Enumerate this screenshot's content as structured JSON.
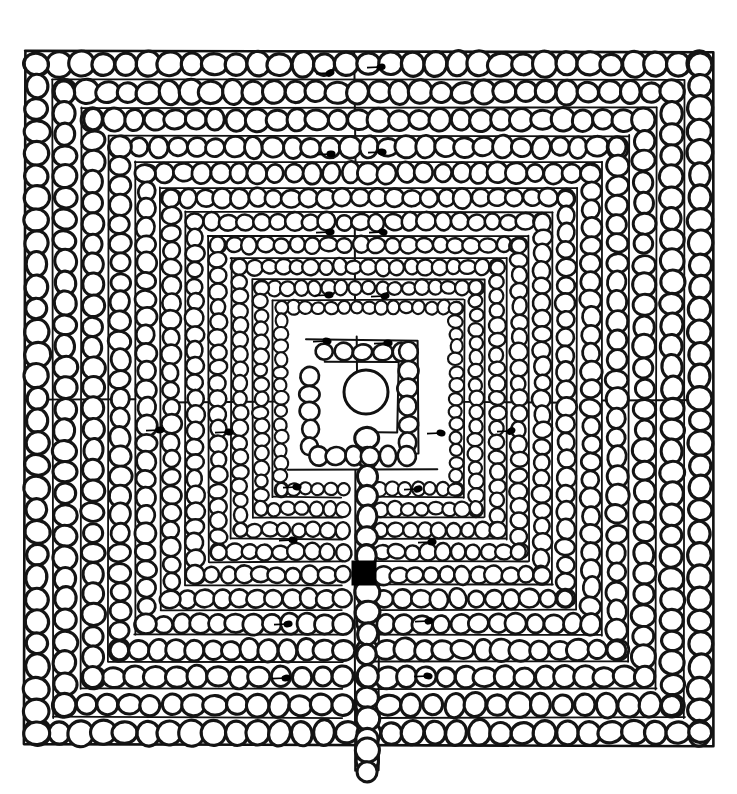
{
  "figure": {
    "style": "hand-drawn ink line drawing",
    "canvas": {
      "width": 737,
      "height": 794
    },
    "colors": {
      "background": "#ffffff",
      "ink": "#111111",
      "stone_fill": "#ffffff",
      "stone_outline": "#141414",
      "goal_marker": "#000000"
    }
  },
  "layout": {
    "outer_border": {
      "x": 25,
      "y": 52,
      "width": 687,
      "height": 693
    },
    "entrance": {
      "side": "bottom",
      "x": 352,
      "y": 745,
      "length": 22
    },
    "center_circle": {
      "cx": 366,
      "cy": 392,
      "r": 22
    },
    "goal_square": {
      "x": 352,
      "y": 561,
      "width": 24,
      "height": 24
    },
    "axis_split_x": 355,
    "axis_split_y": 570,
    "ring_count": 11
  },
  "elements": {
    "outer_frame_label": "outer boundary frame",
    "stone_chain_label": "stone chain wall",
    "path_label": "labyrinth path",
    "center_label": "labyrinth centre",
    "entrance_label": "entrance corridor",
    "goal_label": "goal marker"
  },
  "chart_data": {
    "type": "diagram",
    "subtitle": "",
    "xlabel": "",
    "ylabel": "",
    "legend": [],
    "annotations": [],
    "rings": [
      {
        "index": 0,
        "inset": 0,
        "stone_r": 11.5,
        "label": "ring-1-outer"
      },
      {
        "index": 1,
        "inset": 28,
        "stone_r": 11.0,
        "label": "ring-2"
      },
      {
        "index": 2,
        "inset": 56,
        "stone_r": 10.5,
        "label": "ring-3"
      },
      {
        "index": 3,
        "inset": 83,
        "stone_r": 10.0,
        "label": "ring-4"
      },
      {
        "index": 4,
        "inset": 109,
        "stone_r": 9.5,
        "label": "ring-5"
      },
      {
        "index": 5,
        "inset": 134,
        "stone_r": 9.0,
        "label": "ring-6"
      },
      {
        "index": 6,
        "inset": 158,
        "stone_r": 8.5,
        "label": "ring-7"
      },
      {
        "index": 7,
        "inset": 181,
        "stone_r": 8.0,
        "label": "ring-8"
      },
      {
        "index": 8,
        "inset": 203,
        "stone_r": 7.5,
        "label": "ring-9"
      },
      {
        "index": 9,
        "inset": 224,
        "stone_r": 7.0,
        "label": "ring-10"
      },
      {
        "index": 10,
        "inset": 244,
        "stone_r": 6.5,
        "label": "ring-11-inner"
      }
    ],
    "turn_dots": [
      {
        "x": 330,
        "y": 73,
        "label": "turn-dot-top-left-1"
      },
      {
        "x": 381,
        "y": 67,
        "label": "turn-dot-top-right-1"
      },
      {
        "x": 331,
        "y": 154,
        "label": "turn-dot-top-left-2"
      },
      {
        "x": 382,
        "y": 152,
        "label": "turn-dot-top-right-2"
      },
      {
        "x": 330,
        "y": 232,
        "label": "turn-dot-top-left-3"
      },
      {
        "x": 383,
        "y": 232,
        "label": "turn-dot-top-right-3"
      },
      {
        "x": 329,
        "y": 295,
        "label": "turn-dot-top-left-4"
      },
      {
        "x": 385,
        "y": 296,
        "label": "turn-dot-top-right-4"
      },
      {
        "x": 327,
        "y": 341,
        "label": "turn-dot-inner-left-1"
      },
      {
        "x": 388,
        "y": 343,
        "label": "turn-dot-inner-right-1"
      },
      {
        "x": 160,
        "y": 430,
        "label": "turn-dot-left-mid-1"
      },
      {
        "x": 229,
        "y": 432,
        "label": "turn-dot-left-mid-2"
      },
      {
        "x": 441,
        "y": 433,
        "label": "turn-dot-right-mid-1"
      },
      {
        "x": 511,
        "y": 431,
        "label": "turn-dot-right-mid-2"
      },
      {
        "x": 297,
        "y": 487,
        "label": "turn-dot-inner-low-left"
      },
      {
        "x": 418,
        "y": 489,
        "label": "turn-dot-inner-low-right"
      },
      {
        "x": 293,
        "y": 540,
        "label": "turn-dot-low-left-1"
      },
      {
        "x": 432,
        "y": 542,
        "label": "turn-dot-low-right-1"
      },
      {
        "x": 429,
        "y": 621,
        "label": "turn-dot-low-right-2"
      },
      {
        "x": 428,
        "y": 676,
        "label": "turn-dot-low-right-3"
      },
      {
        "x": 288,
        "y": 624,
        "label": "turn-dot-low-left-2"
      },
      {
        "x": 286,
        "y": 678,
        "label": "turn-dot-low-left-3"
      }
    ]
  }
}
